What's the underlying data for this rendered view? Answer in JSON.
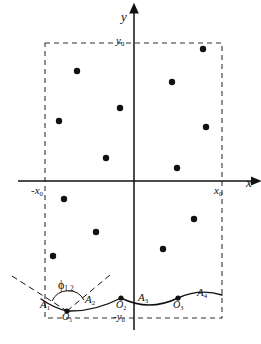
{
  "figure": {
    "background": "#ffffff",
    "ink_color": "#111111",
    "dash_color": "#333333",
    "width": 261,
    "height": 344
  },
  "axes": {
    "x_axis": {
      "label": "x",
      "arrow": "right",
      "y_px": 181,
      "x_start_px": 18,
      "x_end_px": 252
    },
    "y_axis": {
      "label": "y",
      "arrow": "up",
      "x_px": 134,
      "y_start_px": 330,
      "y_end_px": 12
    },
    "origin_px": {
      "x": 134,
      "y": 181
    }
  },
  "tick_labels": {
    "x_min": {
      "text": "-x",
      "sub": "0",
      "x_px": 45,
      "y_px": 188
    },
    "x_max": {
      "text": "x",
      "sub": "0",
      "x_px": 222,
      "y_px": 188
    },
    "y_max": {
      "text": "y",
      "sub": "0",
      "x_px": 134,
      "y_px": 43
    },
    "y_min": {
      "text": "-y",
      "sub": "0",
      "x_px": 134,
      "y_px": 318
    }
  },
  "boundary_box": {
    "name": "dashed-boundary-rectangle",
    "left_px": 45,
    "right_px": 222,
    "top_px": 43,
    "bottom_px": 318,
    "stroke": "#333333",
    "dash": "5 4"
  },
  "points": {
    "label": "scattered sites",
    "radius_px": 3.2,
    "fill": "#111111",
    "coords_px": [
      {
        "x": 77,
        "y": 71
      },
      {
        "x": 120,
        "y": 108
      },
      {
        "x": 59,
        "y": 121
      },
      {
        "x": 106,
        "y": 158
      },
      {
        "x": 203,
        "y": 49
      },
      {
        "x": 172,
        "y": 82
      },
      {
        "x": 206,
        "y": 127
      },
      {
        "x": 177,
        "y": 168
      },
      {
        "x": 64,
        "y": 199
      },
      {
        "x": 96,
        "y": 232
      },
      {
        "x": 53,
        "y": 256
      },
      {
        "x": 194,
        "y": 219
      },
      {
        "x": 163,
        "y": 249
      }
    ]
  },
  "arc_labels": [
    {
      "id": "A1",
      "text": "A",
      "sub": "1",
      "x_px": 46,
      "y_px": 305
    },
    {
      "id": "A2",
      "text": "A",
      "sub": "2",
      "x_px": 90,
      "y_px": 300
    },
    {
      "id": "A3",
      "text": "A",
      "sub": "3",
      "x_px": 143,
      "y_px": 298
    },
    {
      "id": "A4",
      "text": "A",
      "sub": "4",
      "x_px": 202,
      "y_px": 293
    }
  ],
  "cusp_labels": [
    {
      "id": "O1",
      "text": "O",
      "sub": "1",
      "x_px": 67,
      "y_px": 315,
      "dot_px": {
        "x": 67,
        "y": 311
      }
    },
    {
      "id": "O2",
      "text": "O",
      "sub": "2",
      "x_px": 121,
      "y_px": 305,
      "dot_px": {
        "x": 121,
        "y": 298
      }
    },
    {
      "id": "O3",
      "text": "O",
      "sub": "3",
      "x_px": 178,
      "y_px": 305,
      "dot_px": {
        "x": 178,
        "y": 298
      }
    }
  ],
  "angle_marker": {
    "id": "phi_1_2",
    "text": "ϕ",
    "sub": "1,2",
    "x_px": 64,
    "y_px": 285,
    "vertex_px": {
      "x": 67,
      "y": 311
    },
    "description": "angle between the two dashed tangent rays at cusp O1"
  },
  "tangent_lines": [
    {
      "id": "tangent-left",
      "x1_px": 12,
      "y1_px": 276,
      "x2_px": 67,
      "y2_px": 311
    },
    {
      "id": "tangent-right",
      "x1_px": 67,
      "y1_px": 311,
      "x2_px": 110,
      "y2_px": 275
    }
  ],
  "scallop_curve": {
    "id": "scalloped-boundary",
    "stroke": "#111111",
    "path": "M 41 299 Q 54 308 67 311 Q 94 312 121 298 Q 149 312 178 298 Q 200 288 222 295",
    "cusps": [
      {
        "x": 67,
        "y": 311
      },
      {
        "x": 121,
        "y": 298
      },
      {
        "x": 178,
        "y": 298
      }
    ]
  }
}
